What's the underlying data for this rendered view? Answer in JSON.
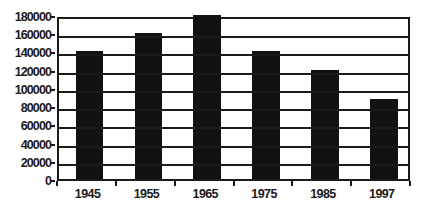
{
  "chart_data": {
    "type": "bar",
    "title": "",
    "subtitle": "",
    "xlabel": "",
    "ylabel": "",
    "categories": [
      "1945",
      "1955",
      "1965",
      "1975",
      "1985",
      "1997"
    ],
    "values": [
      140000,
      160000,
      180000,
      140000,
      120000,
      88000
    ],
    "series": [
      {
        "name": "",
        "values": [
          140000,
          160000,
          180000,
          140000,
          120000,
          88000
        ]
      }
    ],
    "ylim": [
      0,
      180000
    ],
    "ytick_step": 20000,
    "ytick_labels": [
      "180000",
      "160000",
      "140000",
      "120000",
      "100000",
      "80000",
      "60000",
      "40000",
      "20000",
      "0"
    ],
    "ytick_values": [
      180000,
      160000,
      140000,
      120000,
      100000,
      80000,
      60000,
      40000,
      20000,
      0
    ],
    "xtick_labels": [
      "1945",
      "1955",
      "1965",
      "1975",
      "1985",
      "1997"
    ],
    "grid": true,
    "grid_axis": "y",
    "legend": false,
    "legend_position": "none",
    "bar_color": "#111111",
    "axis_color": "#1a1a1a",
    "background_color": "#ffffff",
    "annotations": []
  }
}
